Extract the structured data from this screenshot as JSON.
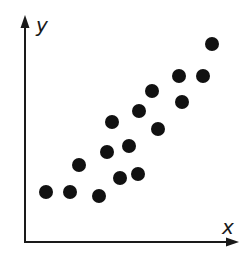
{
  "chart_data": {
    "type": "scatter",
    "title": "",
    "xlabel": "x",
    "ylabel": "y",
    "grid": false,
    "legend": null,
    "x_ticks": [],
    "y_ticks": [],
    "xlim": [
      0,
      10
    ],
    "ylim": [
      0,
      10
    ],
    "points": [
      {
        "x": 1.0,
        "y": 2.2
      },
      {
        "x": 2.1,
        "y": 2.2
      },
      {
        "x": 3.5,
        "y": 2.0
      },
      {
        "x": 2.6,
        "y": 3.4
      },
      {
        "x": 3.9,
        "y": 4.0
      },
      {
        "x": 4.5,
        "y": 2.9
      },
      {
        "x": 4.1,
        "y": 5.3
      },
      {
        "x": 4.9,
        "y": 4.3
      },
      {
        "x": 5.3,
        "y": 3.0
      },
      {
        "x": 5.3,
        "y": 5.8
      },
      {
        "x": 6.2,
        "y": 5.0
      },
      {
        "x": 5.9,
        "y": 6.7
      },
      {
        "x": 7.2,
        "y": 7.4
      },
      {
        "x": 7.4,
        "y": 6.2
      },
      {
        "x": 8.3,
        "y": 7.4
      },
      {
        "x": 8.8,
        "y": 8.8
      }
    ],
    "trend": "positive linear correlation"
  },
  "colors": {
    "axis": "#1a1a1a",
    "point": "#111111",
    "background": "#ffffff"
  },
  "layout": {
    "plot_left": 25,
    "plot_right": 236,
    "plot_top": 20,
    "plot_bottom": 242,
    "px_points": [
      [
        46,
        192
      ],
      [
        70,
        192
      ],
      [
        99,
        196
      ],
      [
        79,
        165
      ],
      [
        107,
        152
      ],
      [
        120,
        178
      ],
      [
        112,
        122
      ],
      [
        129,
        146
      ],
      [
        138,
        174
      ],
      [
        139,
        111
      ],
      [
        158,
        129
      ],
      [
        152,
        91
      ],
      [
        179,
        76
      ],
      [
        182,
        102
      ],
      [
        203,
        76
      ],
      [
        212,
        44
      ]
    ],
    "point_radius": 7
  }
}
